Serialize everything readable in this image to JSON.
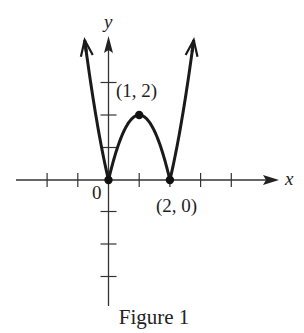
{
  "figure": {
    "caption": "Figure 1"
  },
  "chart_data": {
    "type": "line",
    "title": "Figure 1",
    "function": "y = |2x^2 - 4x|",
    "xlabel": "x",
    "ylabel": "y",
    "x_range_plotted": [
      -0.75,
      2.75
    ],
    "axis_x_range": [
      -3,
      5.5
    ],
    "axis_y_range": [
      -4,
      4.5
    ],
    "x_ticks": [
      -2,
      -1,
      0,
      1,
      2,
      3,
      4
    ],
    "y_ticks": [
      -3,
      -2,
      -1,
      1,
      2,
      3
    ],
    "grid": false,
    "legend": null,
    "series": [
      {
        "name": "f(x)",
        "x": [
          -0.75,
          -0.5,
          -0.25,
          0,
          0.25,
          0.5,
          0.75,
          1,
          1.25,
          1.5,
          1.75,
          2,
          2.25,
          2.5,
          2.75
        ],
        "y": [
          4.125,
          2.5,
          1.125,
          0,
          0.875,
          1.5,
          1.875,
          2,
          1.875,
          1.5,
          0.875,
          0,
          1.125,
          2.5,
          4.125
        ]
      }
    ],
    "marked_points": [
      {
        "x": 0,
        "y": 0,
        "label": "0"
      },
      {
        "x": 1,
        "y": 2,
        "label": "(1, 2)"
      },
      {
        "x": 2,
        "y": 0,
        "label": "(2, 0)"
      }
    ],
    "annotations": [
      "(1, 2)",
      "(2, 0)",
      "0"
    ],
    "colors": {
      "curve": "#1a1a1a",
      "axes": "#333333"
    }
  }
}
